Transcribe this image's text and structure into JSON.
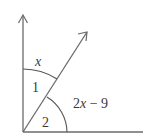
{
  "diagram": {
    "type": "angle-diagram",
    "stroke_color": "#6b6b6b",
    "label_color": "#3a3a3a",
    "rays": [
      {
        "name": "vertical-ray",
        "has_arrow": true
      },
      {
        "name": "diagonal-ray",
        "has_arrow": true
      },
      {
        "name": "horizontal-ray",
        "has_arrow": false
      }
    ],
    "labels": {
      "angle1_measure": "x",
      "angle1_number": "1",
      "angle2_number": "2",
      "angle2_measure_coef": "2",
      "angle2_measure_var": "x",
      "angle2_measure_rest": " − 9"
    }
  }
}
